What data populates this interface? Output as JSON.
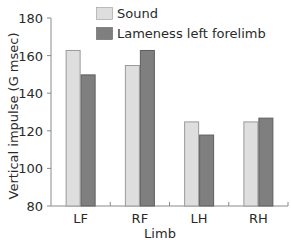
{
  "chart_data": {
    "type": "bar",
    "title": "",
    "xlabel": "Limb",
    "ylabel": "Vertical impulse (G msec)",
    "categories": [
      "LF",
      "RF",
      "LH",
      "RH"
    ],
    "series": [
      {
        "name": "Sound",
        "color": "#dedede",
        "stroke": "#9a9a9a",
        "values": [
          163,
          155,
          125,
          125
        ]
      },
      {
        "name": "Lameness left forelimb",
        "color": "#7f7f7f",
        "stroke": "#5e5e5e",
        "values": [
          150,
          163,
          118,
          127
        ]
      }
    ],
    "ylim": [
      80,
      180
    ],
    "yticks": [
      80,
      100,
      120,
      140,
      160,
      180
    ],
    "grid": false,
    "legend_position": "top-right-inside"
  }
}
